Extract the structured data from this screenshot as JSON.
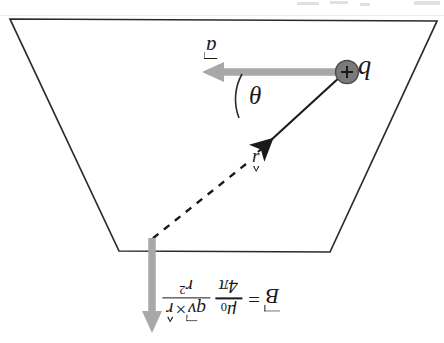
{
  "figure": {
    "background_color": "#ffffff",
    "line_color": "#2b2b2b",
    "gray_vector_color": "#a8a8a8",
    "charge_fill_color": "#7a7a7a",
    "width": 444,
    "height": 343
  },
  "labels": {
    "charge": "b",
    "charge_sign": "+",
    "velocity": "a",
    "angle": "θ",
    "unit_vector": "ɹ"
  },
  "formula": {
    "lhs": "B",
    "equals": "=",
    "constant_numerator": "μ",
    "constant_subscript": "0",
    "constant_denominator_number": "4",
    "constant_denominator_symbol": "π",
    "main_numerator_charge": "q",
    "main_numerator_velocity": "v",
    "main_numerator_cross": "×",
    "main_numerator_unit": "r",
    "main_denominator_symbol": "r",
    "main_denominator_exponent": "2",
    "plain_text": "B = (μ0 / 4π) q v × r / r^2"
  },
  "geometry": {
    "trapezoid_points": "10,19 437,21 330,252 119,251",
    "velocity_arrow": {
      "from_x": 345,
      "from_y": 72,
      "to_x": 205,
      "to_y": 72
    },
    "radius_line": {
      "from_x": 344,
      "from_y": 73,
      "to_x": 252,
      "to_y": 157
    },
    "dashed_line": {
      "from_x": 248,
      "from_y": 162,
      "to_x": 152,
      "to_y": 240
    },
    "field_arrow": {
      "from_x": 152,
      "from_y": 238,
      "to_x": 152,
      "to_y": 332
    },
    "charge_center": {
      "x": 347,
      "y": 72,
      "radius": 11
    },
    "angle_arc_radius": 52
  },
  "artifacts": [
    {
      "x": 297,
      "y": 2,
      "w": 22,
      "h": 3
    },
    {
      "x": 330,
      "y": 1,
      "w": 18,
      "h": 3
    },
    {
      "x": 360,
      "y": 3,
      "w": 10,
      "h": 3
    },
    {
      "x": 414,
      "y": 1,
      "w": 26,
      "h": 4
    },
    {
      "x": 0,
      "y": 15,
      "w": 444,
      "h": 1
    }
  ]
}
